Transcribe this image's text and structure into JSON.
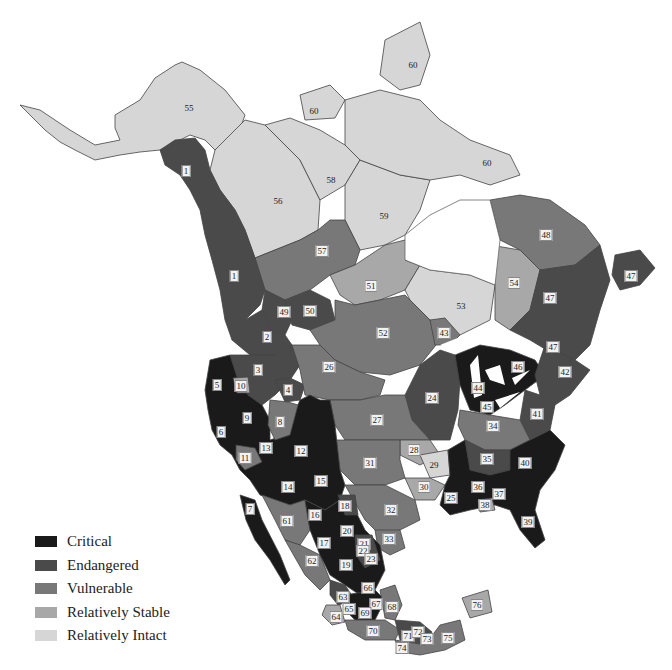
{
  "legend": {
    "items": [
      {
        "label": "Critical",
        "color": "#1a1a1a"
      },
      {
        "label": "Endangered",
        "color": "#4a4a4a"
      },
      {
        "label": "Vulnerable",
        "color": "#787878"
      },
      {
        "label": "Relatively Stable",
        "color": "#a8a8a8"
      },
      {
        "label": "Relatively Intact",
        "color": "#d6d6d6"
      }
    ]
  },
  "colors": {
    "critical": "#1a1a1a",
    "endangered": "#4a4a4a",
    "vulnerable": "#787878",
    "stable": "#a8a8a8",
    "intact": "#d6d6d6",
    "water": "#ffffff",
    "border": "#333333"
  },
  "regions": [
    {
      "id": "1",
      "x": 186,
      "y": 171,
      "status": "endangered"
    },
    {
      "id": "1",
      "x": 234,
      "y": 276,
      "status": "endangered"
    },
    {
      "id": "2",
      "x": 267,
      "y": 337,
      "status": "endangered"
    },
    {
      "id": "3",
      "x": 258,
      "y": 370,
      "status": "endangered"
    },
    {
      "id": "4",
      "x": 288,
      "y": 390,
      "status": "endangered"
    },
    {
      "id": "5",
      "x": 217,
      "y": 385,
      "status": "critical"
    },
    {
      "id": "6",
      "x": 221,
      "y": 432,
      "status": "critical"
    },
    {
      "id": "7",
      "x": 250,
      "y": 509,
      "status": "critical"
    },
    {
      "id": "8",
      "x": 280,
      "y": 422,
      "status": "vulnerable"
    },
    {
      "id": "9",
      "x": 247,
      "y": 418,
      "status": "critical"
    },
    {
      "id": "10",
      "x": 241,
      "y": 386,
      "status": "stable"
    },
    {
      "id": "11",
      "x": 245,
      "y": 458,
      "status": "vulnerable"
    },
    {
      "id": "12",
      "x": 301,
      "y": 451,
      "status": "critical"
    },
    {
      "id": "13",
      "x": 266,
      "y": 448,
      "status": "critical"
    },
    {
      "id": "14",
      "x": 288,
      "y": 487,
      "status": "critical"
    },
    {
      "id": "15",
      "x": 321,
      "y": 481,
      "status": "critical"
    },
    {
      "id": "16",
      "x": 315,
      "y": 515,
      "status": "critical"
    },
    {
      "id": "17",
      "x": 324,
      "y": 543,
      "status": "critical"
    },
    {
      "id": "18",
      "x": 345,
      "y": 506,
      "status": "endangered"
    },
    {
      "id": "19",
      "x": 346,
      "y": 565,
      "status": "critical"
    },
    {
      "id": "20",
      "x": 347,
      "y": 531,
      "status": "critical"
    },
    {
      "id": "21",
      "x": 364,
      "y": 544,
      "status": "endangered"
    },
    {
      "id": "22",
      "x": 363,
      "y": 551,
      "status": "endangered"
    },
    {
      "id": "23",
      "x": 371,
      "y": 559,
      "status": "endangered"
    },
    {
      "id": "24",
      "x": 432,
      "y": 398,
      "status": "endangered"
    },
    {
      "id": "25",
      "x": 451,
      "y": 498,
      "status": "critical"
    },
    {
      "id": "26",
      "x": 329,
      "y": 367,
      "status": "vulnerable"
    },
    {
      "id": "27",
      "x": 377,
      "y": 420,
      "status": "vulnerable"
    },
    {
      "id": "28",
      "x": 414,
      "y": 450,
      "status": "stable"
    },
    {
      "id": "29",
      "x": 434,
      "y": 465,
      "status": "intact"
    },
    {
      "id": "30",
      "x": 424,
      "y": 487,
      "status": "stable"
    },
    {
      "id": "31",
      "x": 370,
      "y": 463,
      "status": "vulnerable"
    },
    {
      "id": "32",
      "x": 391,
      "y": 510,
      "status": "vulnerable"
    },
    {
      "id": "33",
      "x": 389,
      "y": 539,
      "status": "vulnerable"
    },
    {
      "id": "34",
      "x": 493,
      "y": 426,
      "status": "vulnerable"
    },
    {
      "id": "35",
      "x": 487,
      "y": 459,
      "status": "endangered"
    },
    {
      "id": "36",
      "x": 478,
      "y": 487,
      "status": "critical"
    },
    {
      "id": "37",
      "x": 499,
      "y": 494,
      "status": "critical"
    },
    {
      "id": "38",
      "x": 485,
      "y": 505,
      "status": "stable"
    },
    {
      "id": "39",
      "x": 528,
      "y": 522,
      "status": "critical"
    },
    {
      "id": "40",
      "x": 525,
      "y": 463,
      "status": "critical"
    },
    {
      "id": "41",
      "x": 537,
      "y": 414,
      "status": "endangered"
    },
    {
      "id": "42",
      "x": 565,
      "y": 372,
      "status": "endangered"
    },
    {
      "id": "43",
      "x": 444,
      "y": 333,
      "status": "vulnerable"
    },
    {
      "id": "44",
      "x": 478,
      "y": 388,
      "status": "critical"
    },
    {
      "id": "45",
      "x": 487,
      "y": 407,
      "status": "critical"
    },
    {
      "id": "46",
      "x": 518,
      "y": 367,
      "status": "critical"
    },
    {
      "id": "47",
      "x": 550,
      "y": 298,
      "status": "endangered"
    },
    {
      "id": "47",
      "x": 553,
      "y": 347,
      "status": "endangered"
    },
    {
      "id": "47",
      "x": 631,
      "y": 276,
      "status": "endangered"
    },
    {
      "id": "48",
      "x": 546,
      "y": 235,
      "status": "vulnerable"
    },
    {
      "id": "49",
      "x": 284,
      "y": 312,
      "status": "endangered"
    },
    {
      "id": "50",
      "x": 310,
      "y": 311,
      "status": "endangered"
    },
    {
      "id": "51",
      "x": 371,
      "y": 286,
      "status": "stable"
    },
    {
      "id": "52",
      "x": 383,
      "y": 333,
      "status": "vulnerable"
    },
    {
      "id": "53",
      "x": 461,
      "y": 306,
      "status": "intact"
    },
    {
      "id": "54",
      "x": 514,
      "y": 283,
      "status": "stable"
    },
    {
      "id": "55",
      "x": 189,
      "y": 108,
      "status": "intact"
    },
    {
      "id": "56",
      "x": 278,
      "y": 201,
      "status": "intact"
    },
    {
      "id": "57",
      "x": 322,
      "y": 251,
      "status": "vulnerable"
    },
    {
      "id": "58",
      "x": 331,
      "y": 180,
      "status": "intact"
    },
    {
      "id": "59",
      "x": 384,
      "y": 216,
      "status": "intact"
    },
    {
      "id": "60",
      "x": 314,
      "y": 111,
      "status": "intact"
    },
    {
      "id": "60",
      "x": 413,
      "y": 65,
      "status": "intact"
    },
    {
      "id": "60",
      "x": 487,
      "y": 163,
      "status": "intact"
    },
    {
      "id": "61",
      "x": 287,
      "y": 521,
      "status": "vulnerable"
    },
    {
      "id": "62",
      "x": 312,
      "y": 561,
      "status": "vulnerable"
    },
    {
      "id": "63",
      "x": 343,
      "y": 597,
      "status": "endangered"
    },
    {
      "id": "64",
      "x": 336,
      "y": 617,
      "status": "stable"
    },
    {
      "id": "65",
      "x": 349,
      "y": 609,
      "status": "endangered"
    },
    {
      "id": "66",
      "x": 368,
      "y": 588,
      "status": "critical"
    },
    {
      "id": "67",
      "x": 376,
      "y": 604,
      "status": "endangered"
    },
    {
      "id": "68",
      "x": 392,
      "y": 607,
      "status": "vulnerable"
    },
    {
      "id": "69",
      "x": 365,
      "y": 613,
      "status": "critical"
    },
    {
      "id": "70",
      "x": 373,
      "y": 631,
      "status": "vulnerable"
    },
    {
      "id": "71",
      "x": 408,
      "y": 636,
      "status": "endangered"
    },
    {
      "id": "72",
      "x": 418,
      "y": 632,
      "status": "endangered"
    },
    {
      "id": "73",
      "x": 427,
      "y": 639,
      "status": "vulnerable"
    },
    {
      "id": "74",
      "x": 402,
      "y": 648,
      "status": "vulnerable"
    },
    {
      "id": "75",
      "x": 448,
      "y": 638,
      "status": "vulnerable"
    },
    {
      "id": "76",
      "x": 477,
      "y": 605,
      "status": "stable"
    }
  ]
}
